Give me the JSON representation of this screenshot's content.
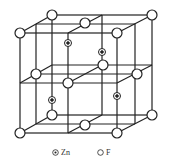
{
  "diagram": {
    "colors": {
      "line": "#222222",
      "atom_fill": "#ffffff",
      "atom_stroke": "#222222"
    },
    "legend": [
      {
        "symbol": "zn-atom",
        "label": "Zn"
      },
      {
        "symbol": "f-atom",
        "label": "F"
      }
    ]
  }
}
